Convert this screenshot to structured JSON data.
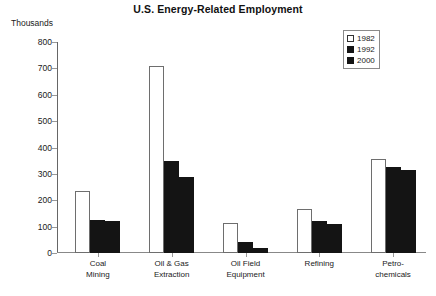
{
  "chart_data": {
    "type": "bar",
    "title": "U.S. Energy-Related Employment",
    "xlabel": "",
    "ylabel": "Thousands",
    "ylim": [
      0,
      800
    ],
    "ytick_step": 100,
    "yticks": [
      0,
      100,
      200,
      300,
      400,
      500,
      600,
      700,
      800
    ],
    "ytick_labels": [
      "0",
      "100",
      "200",
      "300",
      "400",
      "500",
      "600",
      "700",
      "800"
    ],
    "grid": false,
    "legend_position": "top-right",
    "categories": [
      "Coal Mining",
      "Oil & Gas Extraction",
      "Oil Field Equipment",
      "Refining",
      "Petro-chemicals"
    ],
    "category_lines": [
      [
        "Coal",
        "Mining"
      ],
      [
        "Oil & Gas",
        "Extraction"
      ],
      [
        "Oil Field",
        "Equipment"
      ],
      [
        "Refining",
        ""
      ],
      [
        "Petro-",
        "chemicals"
      ]
    ],
    "series": [
      {
        "name": "1982",
        "color": "#ffffff",
        "edge_color": "#6e6e6e",
        "values": [
          235,
          710,
          115,
          165,
          355
        ]
      },
      {
        "name": "1992",
        "color": "#141414",
        "edge_color": "#141414",
        "values": [
          125,
          350,
          40,
          120,
          325
        ]
      },
      {
        "name": "2000",
        "color": "#141414",
        "edge_color": "#141414",
        "values": [
          120,
          290,
          20,
          110,
          315
        ]
      }
    ]
  },
  "legend": {
    "entries": [
      {
        "label": "1982"
      },
      {
        "label": "1992"
      },
      {
        "label": "2000"
      }
    ]
  }
}
